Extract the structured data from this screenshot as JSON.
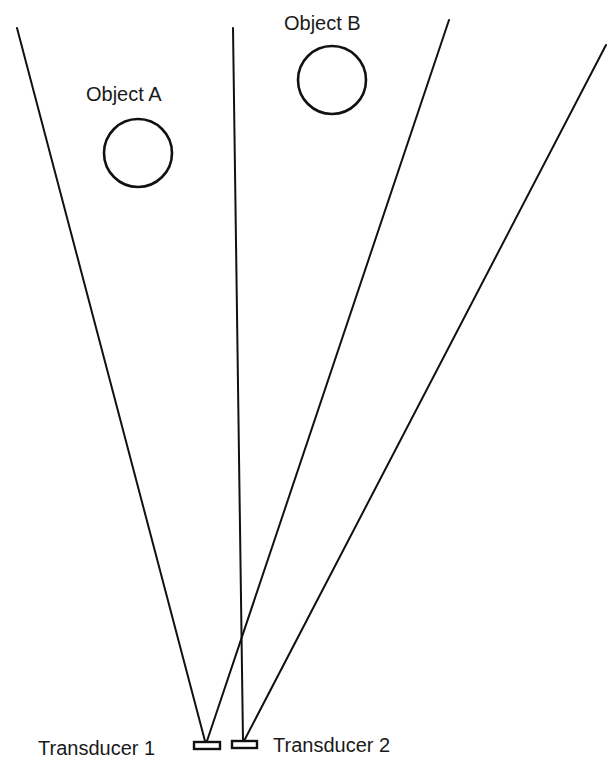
{
  "diagram": {
    "objects": [
      {
        "label": "Object A",
        "cx": 138,
        "cy": 153,
        "r": 34,
        "label_x": 86,
        "label_y": 101
      },
      {
        "label": "Object B",
        "cx": 332,
        "cy": 80,
        "r": 34,
        "label_x": 284,
        "label_y": 30
      }
    ],
    "transducers": [
      {
        "label": "Transducer 1",
        "x": 194,
        "y": 742,
        "w": 26,
        "h": 7,
        "label_x": 38,
        "label_y": 755
      },
      {
        "label": "Transducer 2",
        "x": 232,
        "y": 741,
        "w": 25,
        "h": 7,
        "label_x": 273,
        "label_y": 752
      }
    ],
    "beams": [
      {
        "name": "transducer-1-beam-left",
        "x1": 17,
        "y1": 28,
        "x2": 205,
        "y2": 741
      },
      {
        "name": "transducer-1-beam-right",
        "x1": 449,
        "y1": 20,
        "x2": 207,
        "y2": 741
      },
      {
        "name": "transducer-2-beam-left",
        "x1": 233,
        "y1": 28,
        "x2": 243,
        "y2": 741
      },
      {
        "name": "transducer-2-beam-right",
        "x1": 606,
        "y1": 45,
        "x2": 244,
        "y2": 741
      }
    ]
  }
}
